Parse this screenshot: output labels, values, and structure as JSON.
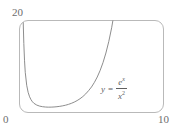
{
  "figure": {
    "name": "exponential-over-square-plot",
    "frame": {
      "border_color": "#b9b9b9",
      "rounded": true
    },
    "curve_color": "#808080"
  },
  "labels": {
    "y_max": "20",
    "x_min": "0",
    "x_max": "10"
  },
  "equation": {
    "lhs": "y",
    "equals": "=",
    "numerator_base": "e",
    "numerator_exponent": "x",
    "denominator_base": "x",
    "denominator_exponent": "2",
    "plain": "y = e^x / x^2"
  },
  "chart_data": {
    "type": "line",
    "title": "",
    "subtitle": "",
    "xlabel": "",
    "ylabel": "",
    "xlim": [
      0,
      10
    ],
    "ylim": [
      0,
      20
    ],
    "grid": false,
    "legend": null,
    "annotations": [
      {
        "text": "y = e^x / x^2",
        "x": 6.1,
        "y": 7.0
      }
    ],
    "xticks": [
      0,
      10
    ],
    "yticks": [
      0,
      20
    ],
    "xtick_labels": [
      "0",
      "10"
    ],
    "ytick_labels": [
      "0",
      "20"
    ],
    "series": [
      {
        "name": "y = e^x / x^2",
        "color": "#808080",
        "x": [
          0.25,
          0.3,
          0.35,
          0.4,
          0.5,
          0.6,
          0.7,
          0.8,
          0.9,
          1.0,
          1.2,
          1.4,
          1.6,
          1.8,
          2.0,
          2.2,
          2.4,
          2.6,
          2.8,
          3.0,
          3.2,
          3.4,
          3.6,
          3.8,
          4.0,
          4.2,
          4.4,
          4.6,
          4.8,
          5.0,
          5.2,
          5.4,
          5.6,
          5.8,
          6.0,
          6.2,
          6.4,
          6.6,
          6.8,
          7.0,
          7.2,
          7.4,
          7.5
        ],
        "y": [
          20.54,
          15.0,
          11.25,
          8.72,
          5.93,
          4.39,
          3.42,
          2.78,
          2.33,
          2.0,
          1.61,
          1.39,
          1.26,
          1.19,
          1.16,
          1.17,
          1.2,
          1.26,
          1.34,
          1.45,
          1.59,
          1.77,
          1.99,
          2.26,
          2.59,
          2.99,
          3.47,
          4.05,
          4.76,
          5.55,
          6.54,
          7.72,
          9.14,
          10.86,
          12.93,
          15.42,
          18.44,
          22.1,
          26.52,
          31.88,
          38.37,
          46.25,
          50.62
        ],
        "note": "y = e^x / x^2 over x in (0, 10]; curve exits top of frame near x = 7.0"
      }
    ]
  }
}
